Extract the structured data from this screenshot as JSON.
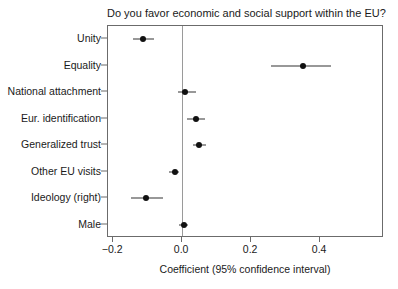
{
  "chart_data": {
    "type": "scatter",
    "title": "Do you favor economic and social support within the EU?",
    "xlabel": "Coefficient (95% confidence interval)",
    "ylabel": "",
    "xlim": [
      -0.215,
      0.585
    ],
    "ylim": [
      0,
      8
    ],
    "grid": false,
    "legend": null,
    "xticks": [
      -0.2,
      0.0,
      0.2,
      0.4
    ],
    "xticklabels": [
      "−0.2",
      "0.0",
      "0.2",
      "0.4"
    ],
    "reference_line_x": 0.0,
    "categories": [
      "Unity",
      "Equality",
      "National attachment",
      "Eur. identification",
      "Generalized trust",
      "Other EU visits",
      "Ideology (right)",
      "Male"
    ],
    "values": [
      -0.115,
      0.349,
      0.007,
      0.039,
      0.05,
      -0.022,
      -0.106,
      0.005
    ],
    "ci_low": [
      -0.142,
      0.258,
      -0.012,
      0.015,
      0.03,
      -0.037,
      -0.147,
      -0.008
    ],
    "ci_high": [
      -0.082,
      0.431,
      0.041,
      0.065,
      0.07,
      -0.008,
      -0.057,
      0.018
    ],
    "points": [
      {
        "label": "Unity",
        "estimate": -0.115,
        "ci_low": -0.142,
        "ci_high": -0.082
      },
      {
        "label": "Equality",
        "estimate": 0.349,
        "ci_low": 0.258,
        "ci_high": 0.431
      },
      {
        "label": "National attachment",
        "estimate": 0.007,
        "ci_low": -0.012,
        "ci_high": 0.041
      },
      {
        "label": "Eur. identification",
        "estimate": 0.039,
        "ci_low": 0.015,
        "ci_high": 0.065
      },
      {
        "label": "Generalized trust",
        "estimate": 0.05,
        "ci_low": 0.03,
        "ci_high": 0.07
      },
      {
        "label": "Other EU visits",
        "estimate": -0.022,
        "ci_low": -0.037,
        "ci_high": -0.008
      },
      {
        "label": "Ideology (right)",
        "estimate": -0.106,
        "ci_low": -0.147,
        "ci_high": -0.057
      },
      {
        "label": "Male",
        "estimate": 0.005,
        "ci_low": -0.008,
        "ci_high": 0.018
      }
    ],
    "colors": {
      "point": "#111111",
      "whisker": "#333333",
      "frame": "#6b6b6b",
      "reference_line": "#9a9a9a",
      "text": "#1a1a1a",
      "background": "#ffffff"
    }
  }
}
